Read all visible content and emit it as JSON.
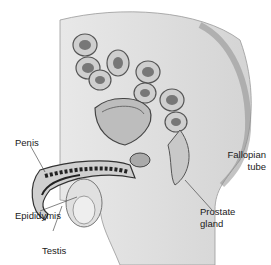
{
  "diagram": {
    "labels": {
      "penis": "Penis",
      "epididymis": "Epididymis",
      "testis": "Testis",
      "prostate_line1": "Prostate",
      "prostate_line2": "gland",
      "fallopian_line1": "Fallopian",
      "fallopian_line2": "tube"
    }
  }
}
